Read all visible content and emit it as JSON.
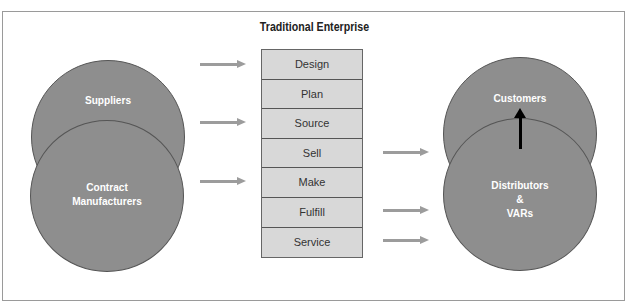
{
  "title": "Traditional Enterprise",
  "left_entities": {
    "top": "Suppliers",
    "bottom_line1": "Contract",
    "bottom_line2": "Manufacturers"
  },
  "right_entities": {
    "top": "Customers",
    "bottom_line1": "Distributors",
    "bottom_line2": "&",
    "bottom_line3": "VARs"
  },
  "process_steps": [
    "Design",
    "Plan",
    "Source",
    "Sell",
    "Make",
    "Fulfill",
    "Service"
  ],
  "inbound_arrows_to": [
    "Design",
    "Source",
    "Make"
  ],
  "outbound_arrows_from": [
    "Sell",
    "Fulfill",
    "Service"
  ],
  "colors": {
    "circle_fill": "#8e8e8e",
    "step_fill": "#d8d8d8",
    "arrow_gray": "#9c9c9c",
    "arrow_black": "#000000"
  }
}
